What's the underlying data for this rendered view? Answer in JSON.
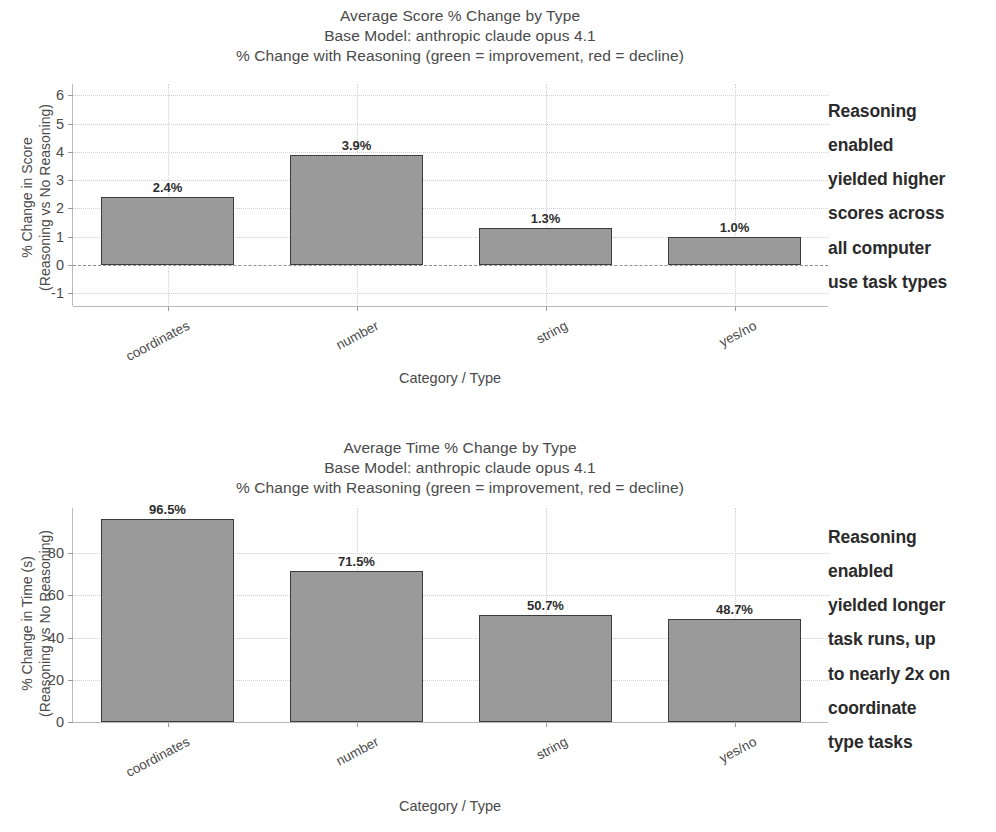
{
  "figures": [
    {
      "id": "score",
      "title_lines": [
        "Average Score % Change by Type",
        "Base Model:  anthropic claude opus 4.1",
        "% Change with Reasoning (green = improvement, red = decline)"
      ],
      "ylabel_lines": [
        "% Change in Score",
        "(Reasoning vs No Reasoning)"
      ],
      "xlabel": "Category / Type",
      "annotation_lines": [
        "Reasoning",
        "enabled",
        "yielded higher",
        "scores across",
        "all computer",
        "use task types"
      ],
      "chart_data": {
        "type": "bar",
        "title": "Average Score % Change by Type",
        "subtitle": "Base Model:  anthropic claude opus 4.1",
        "subtitle2": "% Change with Reasoning (green = improvement, red = decline)",
        "xlabel": "Category / Type",
        "ylabel": "% Change in Score (Reasoning vs No Reasoning)",
        "categories": [
          "coordinates",
          "number",
          "string",
          "yes/no"
        ],
        "values": [
          2.4,
          3.9,
          1.3,
          1.0
        ],
        "value_labels": [
          "2.4%",
          "3.9%",
          "1.3%",
          "1.0%"
        ],
        "yticks": [
          -1,
          0,
          1,
          2,
          3,
          4,
          5,
          6
        ],
        "ytick_labels": [
          "-1",
          "0",
          "1",
          "2",
          "3",
          "4",
          "5",
          "6"
        ],
        "ylim": [
          -1.45,
          6.4
        ],
        "grid": true,
        "legend": "none",
        "bar_color": "#9a9a9a",
        "bar_edge_color": "#3d3d3d"
      }
    },
    {
      "id": "time",
      "title_lines": [
        "Average Time % Change by Type",
        "Base Model:  anthropic claude opus 4.1",
        "% Change with Reasoning (green = improvement, red = decline)"
      ],
      "ylabel_lines": [
        "% Change in Time (s)",
        "(Reasoning vs No Reasoning)"
      ],
      "xlabel": "Category / Type",
      "annotation_lines": [
        "Reasoning",
        "enabled",
        "yielded longer",
        "task runs, up",
        "to nearly 2x on",
        "coordinate",
        "type tasks"
      ],
      "chart_data": {
        "type": "bar",
        "title": "Average Time % Change by Type",
        "subtitle": "Base Model:  anthropic claude opus 4.1",
        "subtitle2": "% Change with Reasoning (green = improvement, red = decline)",
        "xlabel": "Category / Type",
        "ylabel": "% Change in Time (s) (Reasoning vs No Reasoning)",
        "categories": [
          "coordinates",
          "number",
          "string",
          "yes/no"
        ],
        "values": [
          96.5,
          71.5,
          50.7,
          48.7
        ],
        "value_labels": [
          "96.5%",
          "71.5%",
          "50.7%",
          "48.7%"
        ],
        "yticks": [
          0,
          20,
          40,
          60,
          80
        ],
        "ytick_labels": [
          "0",
          "20",
          "40",
          "60",
          "80"
        ],
        "ylim": [
          0,
          101.5
        ],
        "grid": true,
        "legend": "none",
        "bar_color": "#9a9a9a",
        "bar_edge_color": "#3d3d3d"
      }
    }
  ]
}
